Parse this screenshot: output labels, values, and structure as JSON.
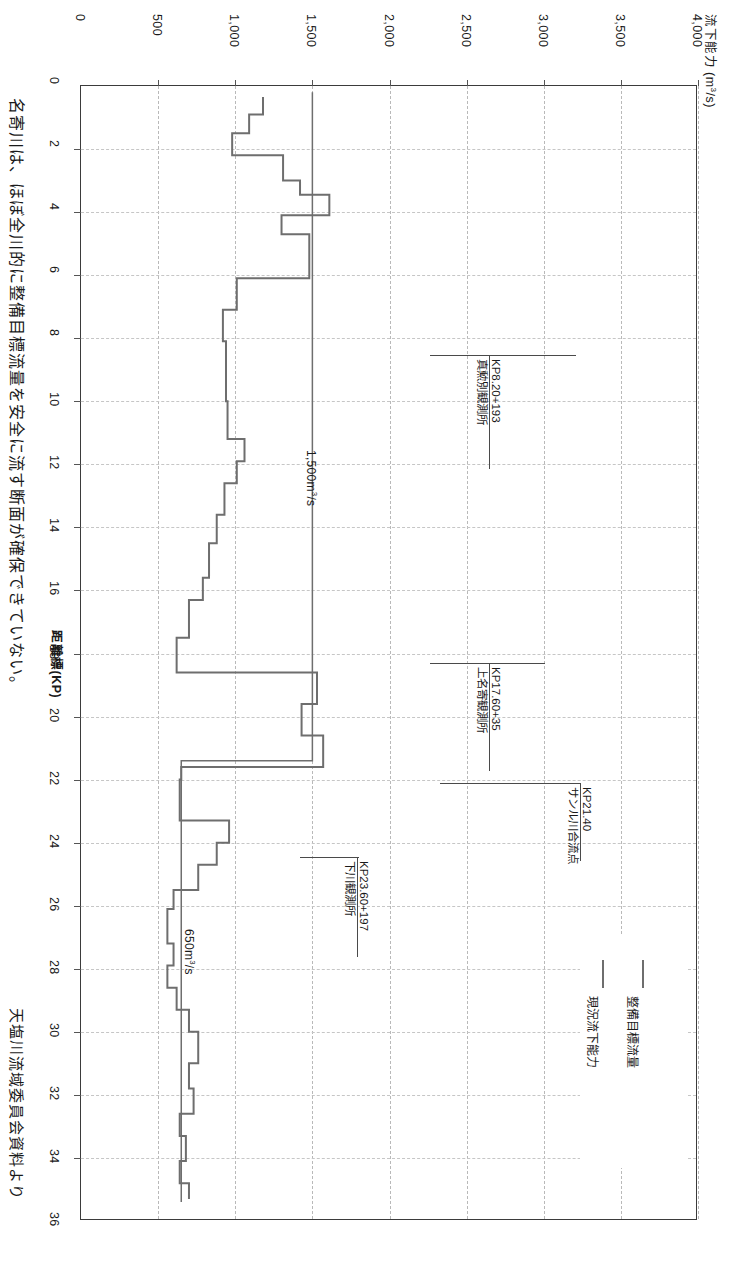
{
  "figure": {
    "y_axis_title": "流下能力 (m3/s)",
    "x_axis_title": "距離標(KP)",
    "side_note": "名寄川は、ほぼ全川的に整備目標流量を安全に流す断面が確保できていない。",
    "source_note": "天塩川流域委員会資料より"
  },
  "legend": {
    "items": [
      {
        "label": "整備目標流量",
        "color": "#6e6e6e"
      },
      {
        "label": "現況流下能力",
        "color": "#6e6e6e"
      }
    ]
  },
  "inline_labels": [
    {
      "text": "1,500m3/s",
      "value": 1500
    },
    {
      "text": "650m3/s",
      "value": 650
    }
  ],
  "annotations": [
    {
      "name": "真勲別観測所",
      "kp_text": "KP8.20+193",
      "kp": 8.2
    },
    {
      "name": "上名寄観測所",
      "kp_text": "KP17.60+35",
      "kp": 17.6
    },
    {
      "name": "サンル川合流点",
      "kp_text": "KP21.40",
      "kp": 21.4
    },
    {
      "name": "下川観測所",
      "kp_text": "KP23.60+197",
      "kp": 23.6
    }
  ],
  "chart_data": {
    "type": "line",
    "orientation": "horizontal-rotated",
    "xlabel": "距離標(KP)",
    "ylabel": "流下能力 (m3/s)",
    "xlim": [
      0,
      36
    ],
    "ylim": [
      0,
      4000
    ],
    "xticks": [
      0,
      2,
      4,
      6,
      8,
      10,
      12,
      14,
      16,
      18,
      20,
      22,
      24,
      26,
      28,
      30,
      32,
      34,
      36
    ],
    "xticklabels": [
      "0",
      "2",
      "4",
      "6",
      "8",
      "10",
      "12",
      "14",
      "16",
      "18",
      "20",
      "22",
      "24",
      "26",
      "28",
      "30",
      "32",
      "34",
      "36"
    ],
    "yticks": [
      0,
      500,
      1000,
      1500,
      2000,
      2500,
      3000,
      3500,
      4000
    ],
    "yticklabels": [
      "0",
      "500",
      "1,000",
      "1,500",
      "2,000",
      "2,500",
      "3,000",
      "3,500",
      "4,000"
    ],
    "grid": true,
    "legend_position": "lower-right",
    "series": [
      {
        "name": "整備目標流量",
        "color": "#6e6e6e",
        "step": true,
        "points": [
          [
            0.2,
            1500
          ],
          [
            21.4,
            1500
          ],
          [
            21.4,
            650
          ],
          [
            35.4,
            650
          ]
        ]
      },
      {
        "name": "現況流下能力",
        "color": "#6e6e6e",
        "step": true,
        "points": [
          [
            0.35,
            1180
          ],
          [
            0.9,
            1180
          ],
          [
            0.9,
            1090
          ],
          [
            1.5,
            1090
          ],
          [
            1.5,
            980
          ],
          [
            2.2,
            980
          ],
          [
            2.2,
            1310
          ],
          [
            3.0,
            1310
          ],
          [
            3.0,
            1420
          ],
          [
            3.45,
            1420
          ],
          [
            3.45,
            1610
          ],
          [
            4.1,
            1610
          ],
          [
            4.1,
            1300
          ],
          [
            4.7,
            1300
          ],
          [
            4.7,
            1480
          ],
          [
            6.1,
            1480
          ],
          [
            6.1,
            1010
          ],
          [
            7.1,
            1010
          ],
          [
            7.1,
            920
          ],
          [
            8.1,
            920
          ],
          [
            8.1,
            940
          ],
          [
            10.0,
            940
          ],
          [
            10.0,
            950
          ],
          [
            11.2,
            950
          ],
          [
            11.2,
            1060
          ],
          [
            11.9,
            1060
          ],
          [
            11.9,
            1010
          ],
          [
            12.6,
            1010
          ],
          [
            12.6,
            930
          ],
          [
            13.6,
            930
          ],
          [
            13.6,
            880
          ],
          [
            14.5,
            880
          ],
          [
            14.5,
            830
          ],
          [
            15.6,
            830
          ],
          [
            15.6,
            790
          ],
          [
            16.3,
            790
          ],
          [
            16.3,
            700
          ],
          [
            17.5,
            700
          ],
          [
            17.5,
            620
          ],
          [
            18.6,
            620
          ],
          [
            18.6,
            1530
          ],
          [
            19.6,
            1530
          ],
          [
            19.6,
            1430
          ],
          [
            20.6,
            1430
          ],
          [
            20.6,
            1570
          ],
          [
            21.6,
            1570
          ],
          [
            21.6,
            650
          ],
          [
            22.0,
            650
          ],
          [
            22.0,
            640
          ],
          [
            23.3,
            640
          ],
          [
            23.3,
            960
          ],
          [
            24.0,
            960
          ],
          [
            24.0,
            880
          ],
          [
            24.7,
            880
          ],
          [
            24.7,
            760
          ],
          [
            25.5,
            760
          ],
          [
            25.5,
            600
          ],
          [
            26.1,
            600
          ],
          [
            26.1,
            560
          ],
          [
            27.2,
            560
          ],
          [
            27.2,
            600
          ],
          [
            27.9,
            600
          ],
          [
            27.9,
            560
          ],
          [
            28.6,
            560
          ],
          [
            28.6,
            620
          ],
          [
            29.3,
            620
          ],
          [
            29.3,
            700
          ],
          [
            30.0,
            700
          ],
          [
            30.0,
            760
          ],
          [
            31.0,
            760
          ],
          [
            31.0,
            700
          ],
          [
            31.8,
            700
          ],
          [
            31.8,
            730
          ],
          [
            32.6,
            730
          ],
          [
            32.6,
            640
          ],
          [
            33.3,
            640
          ],
          [
            33.3,
            680
          ],
          [
            34.1,
            680
          ],
          [
            34.1,
            640
          ],
          [
            34.8,
            640
          ],
          [
            34.8,
            700
          ],
          [
            35.3,
            700
          ]
        ]
      }
    ]
  }
}
